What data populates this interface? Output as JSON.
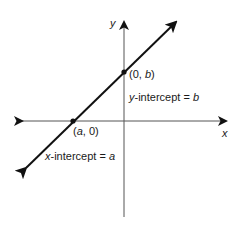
{
  "diagram": {
    "type": "coordinate-plane-line-intercepts",
    "axes": {
      "x_label": "x",
      "y_label": "y"
    },
    "points": [
      {
        "id": "y-intercept-point",
        "label_prefix": "(0, ",
        "label_var": "b",
        "label_suffix": ")"
      },
      {
        "id": "x-intercept-point",
        "label_prefix": "(",
        "label_var": "a",
        "label_suffix": ", 0)"
      }
    ],
    "annotations": {
      "y_intercept": {
        "var": "y",
        "text": "-intercept = ",
        "value": "b"
      },
      "x_intercept": {
        "var": "x",
        "text": "-intercept = ",
        "value": "a"
      }
    },
    "colors": {
      "axis": "#555555",
      "line": "#111111",
      "text": "#1a1a1a"
    }
  }
}
